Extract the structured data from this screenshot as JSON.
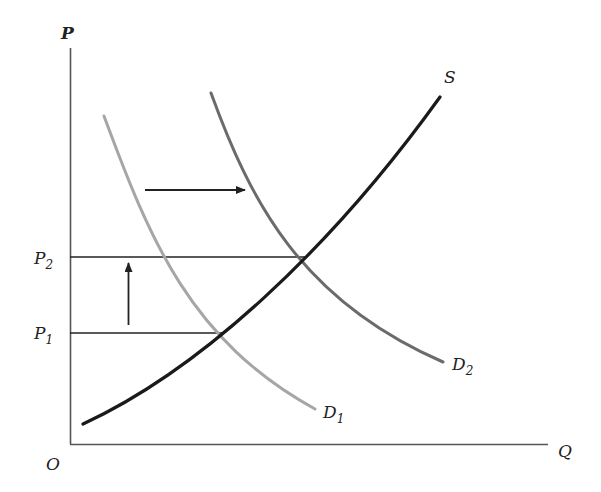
{
  "diagram": {
    "type": "supply-demand",
    "axes": {
      "y_label": "P",
      "x_label": "Q",
      "origin_label": "O"
    },
    "curves": {
      "supply": {
        "label": "S",
        "color": "#1a1a1a"
      },
      "demand_1": {
        "label": "D",
        "subscript": "1",
        "color": "#a6a6a6"
      },
      "demand_2": {
        "label": "D",
        "subscript": "2",
        "color": "#6b6b6b"
      }
    },
    "price_levels": [
      {
        "label": "P",
        "subscript": "2"
      },
      {
        "label": "P",
        "subscript": "1"
      }
    ],
    "arrows": {
      "demand_shift": "right",
      "price_change": "up"
    }
  },
  "colors": {
    "axis": "#555555",
    "supply": "#1a1a1a",
    "demand_1": "#a6a6a6",
    "demand_2": "#6b6b6b",
    "guide": "#222222"
  }
}
